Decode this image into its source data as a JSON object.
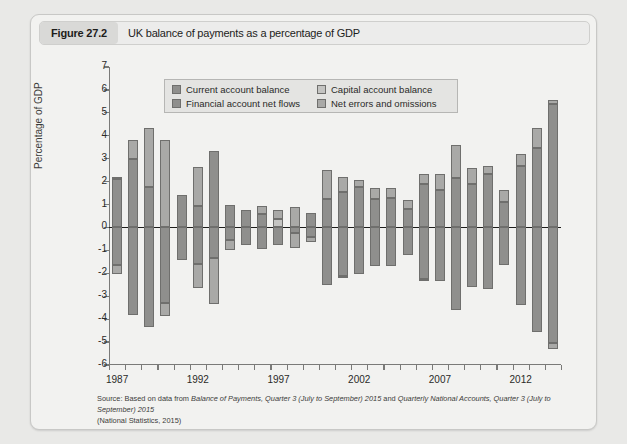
{
  "figure": {
    "number_label": "Figure 27.2",
    "caption": "UK balance of payments as a percentage of GDP"
  },
  "source_note": {
    "line1_prefix": "Source: Based on data from ",
    "line1_italic_a": "Balance of Payments, Quarter 3 (July to September) 2015",
    "line1_mid": " and ",
    "line1_italic_b": "Quarterly National Accounts, Quarter 3 (July to September) 2015",
    "line2": "(National Statistics, 2015)"
  },
  "chart_data": {
    "type": "bar",
    "subtype": "stacked-diverging",
    "title": "UK balance of payments as a percentage of GDP",
    "xlabel": "",
    "ylabel": "Percentage of GDP",
    "ylim": [
      -6,
      7
    ],
    "ytick_labels": [
      "7",
      "6",
      "5",
      "4",
      "3",
      "2",
      "1",
      "0",
      "-1",
      "-2",
      "-3",
      "-4",
      "-5",
      "-6"
    ],
    "ytick_values": [
      7,
      6,
      5,
      4,
      3,
      2,
      1,
      0,
      -1,
      -2,
      -3,
      -4,
      -5,
      -6
    ],
    "xtick_labels": [
      "1987",
      "1992",
      "1997",
      "2002",
      "2007",
      "2012"
    ],
    "xtick_values": [
      1987,
      1992,
      1997,
      2002,
      2007,
      2012
    ],
    "grid": false,
    "legend_position": "upper-left-inside",
    "categories": [
      1987,
      1988,
      1989,
      1990,
      1991,
      1992,
      1993,
      1994,
      1995,
      1996,
      1997,
      1998,
      1999,
      2000,
      2001,
      2002,
      2003,
      2004,
      2005,
      2006,
      2007,
      2008,
      2009,
      2010,
      2011,
      2012,
      2013,
      2014
    ],
    "series": [
      {
        "name": "Current account balance",
        "color": "#8f8f8d",
        "values": [
          -1.7,
          -3.8,
          -4.3,
          -3.3,
          -1.4,
          -1.7,
          -1.5,
          -0.6,
          -0.8,
          -0.6,
          0.0,
          -0.4,
          -2.6,
          -2.4,
          -2.0,
          -1.9,
          -1.6,
          -1.9,
          -2.2,
          -2.7,
          -2.3,
          -3.4,
          -2.8,
          -2.7,
          -1.7,
          -3.4,
          -4.5,
          -5.2
        ],
        "axis_side": "negative"
      },
      {
        "name": "Capital account balance",
        "color": "#bdbdbb",
        "values": [
          0.1,
          0.1,
          0.1,
          0.1,
          0.1,
          0.1,
          0.1,
          0.1,
          0.1,
          0.1,
          0.1,
          0.1,
          0.1,
          0.1,
          0.1,
          0.1,
          0.1,
          0.1,
          0.1,
          0.1,
          0.1,
          0.1,
          0.1,
          0.1,
          0.1,
          0.1,
          0.1,
          0.1
        ],
        "axis_side": "positive"
      },
      {
        "name": "Financial account net flows",
        "color": "#8f8f8d",
        "values": [
          2.1,
          3.0,
          1.75,
          0.0,
          1.4,
          0.9,
          1.0,
          0.5,
          0.4,
          0.2,
          -0.15,
          0.1,
          1.3,
          2.05,
          1.6,
          1.5,
          1.2,
          1.7,
          1.9,
          2.1,
          1.6,
          2.9,
          2.3,
          2.7,
          1.6,
          2.7,
          3.5,
          5.4
        ],
        "axis_side": "positive"
      },
      {
        "name": "Net errors and omissions",
        "color": "#a8a8a6",
        "values": [
          0.1,
          0.8,
          2.6,
          4.35,
          0.5,
          1.75,
          0.4,
          0.9,
          0.6,
          0.5,
          0.9,
          0.8,
          1.2,
          0.6,
          0.5,
          0.2,
          0.5,
          0.6,
          0.4,
          0.5,
          0.3,
          0.7,
          0.4,
          0.5,
          0.1,
          0.5,
          0.9,
          0.15
        ],
        "axis_side": "positive"
      }
    ],
    "bars": [
      {
        "year": 1987,
        "pos": [
          [
            0,
            2.1,
            "financial"
          ],
          [
            2.1,
            2.2,
            "errors"
          ]
        ],
        "neg": [
          [
            0,
            -1.65,
            "current"
          ],
          [
            -1.65,
            -2.05,
            "errors2"
          ]
        ]
      },
      {
        "year": 1988,
        "pos": [
          [
            0,
            3.0,
            "financial"
          ],
          [
            3.0,
            3.8,
            "errors"
          ]
        ],
        "neg": [
          [
            0,
            -3.8,
            "current"
          ]
        ]
      },
      {
        "year": 1989,
        "pos": [
          [
            0,
            1.75,
            "financial"
          ],
          [
            1.75,
            4.35,
            "errors"
          ]
        ],
        "neg": [
          [
            0,
            -4.35,
            "current"
          ]
        ]
      },
      {
        "year": 1990,
        "pos": [
          [
            0,
            3.8,
            "errors"
          ]
        ],
        "neg": [
          [
            0,
            -3.3,
            "current"
          ],
          [
            -3.3,
            -3.85,
            "errors2"
          ]
        ]
      },
      {
        "year": 1991,
        "pos": [
          [
            0,
            1.4,
            "financial"
          ]
        ],
        "neg": [
          [
            0,
            -1.4,
            "current"
          ]
        ]
      },
      {
        "year": 1992,
        "pos": [
          [
            0,
            0.95,
            "financial"
          ],
          [
            0.95,
            2.65,
            "errors"
          ]
        ],
        "neg": [
          [
            0,
            -1.6,
            "current"
          ],
          [
            -1.6,
            -2.65,
            "errors2"
          ]
        ]
      },
      {
        "year": 1993,
        "pos": [
          [
            0,
            3.35,
            "financial"
          ]
        ],
        "neg": [
          [
            0,
            -1.35,
            "current"
          ],
          [
            -1.35,
            -3.35,
            "errors2"
          ]
        ]
      },
      {
        "year": 1994,
        "pos": [
          [
            0,
            1.0,
            "financial"
          ]
        ],
        "neg": [
          [
            0,
            -0.55,
            "current"
          ],
          [
            -0.55,
            -1.0,
            "errors2"
          ]
        ]
      },
      {
        "year": 1995,
        "pos": [
          [
            0,
            0.75,
            "financial"
          ]
        ],
        "neg": [
          [
            0,
            -0.75,
            "current"
          ]
        ]
      },
      {
        "year": 1996,
        "pos": [
          [
            0,
            0.6,
            "financial"
          ],
          [
            0.6,
            0.95,
            "errors"
          ]
        ],
        "neg": [
          [
            0,
            -0.95,
            "current"
          ]
        ]
      },
      {
        "year": 1997,
        "pos": [
          [
            0,
            0.35,
            "capital"
          ],
          [
            0.35,
            0.75,
            "errors"
          ]
        ],
        "neg": [
          [
            0,
            -0.75,
            "current"
          ]
        ]
      },
      {
        "year": 1998,
        "pos": [
          [
            0,
            0.9,
            "errors"
          ]
        ],
        "neg": [
          [
            0,
            -0.25,
            "current"
          ],
          [
            -0.25,
            -0.9,
            "errors2"
          ]
        ]
      },
      {
        "year": 1999,
        "pos": [
          [
            0,
            0.65,
            "financial"
          ]
        ],
        "neg": [
          [
            0,
            -0.4,
            "current"
          ],
          [
            -0.4,
            -0.65,
            "errors2"
          ]
        ]
      },
      {
        "year": 2000,
        "pos": [
          [
            0,
            1.25,
            "financial"
          ],
          [
            1.25,
            2.5,
            "errors"
          ]
        ],
        "neg": [
          [
            0,
            -2.5,
            "current"
          ]
        ]
      },
      {
        "year": 2001,
        "pos": [
          [
            0,
            1.55,
            "financial"
          ],
          [
            1.55,
            2.2,
            "errors"
          ]
        ],
        "neg": [
          [
            0,
            -2.1,
            "current"
          ],
          [
            -2.1,
            -2.2,
            "errors2"
          ]
        ]
      },
      {
        "year": 2002,
        "pos": [
          [
            0,
            1.75,
            "financial"
          ],
          [
            1.75,
            2.05,
            "errors"
          ]
        ],
        "neg": [
          [
            0,
            -2.05,
            "current"
          ]
        ]
      },
      {
        "year": 2003,
        "pos": [
          [
            0,
            1.25,
            "financial"
          ],
          [
            1.25,
            1.7,
            "errors"
          ]
        ],
        "neg": [
          [
            0,
            -1.7,
            "current"
          ]
        ]
      },
      {
        "year": 2004,
        "pos": [
          [
            0,
            1.3,
            "financial"
          ],
          [
            1.3,
            1.7,
            "errors"
          ]
        ],
        "neg": [
          [
            0,
            -1.7,
            "current"
          ]
        ]
      },
      {
        "year": 2005,
        "pos": [
          [
            0,
            0.8,
            "financial"
          ],
          [
            0.8,
            1.2,
            "errors"
          ]
        ],
        "neg": [
          [
            0,
            -1.2,
            "current"
          ]
        ]
      },
      {
        "year": 2006,
        "pos": [
          [
            0,
            1.9,
            "financial"
          ],
          [
            1.9,
            2.35,
            "errors"
          ]
        ],
        "neg": [
          [
            0,
            -2.25,
            "current"
          ],
          [
            -2.25,
            -2.35,
            "errors2"
          ]
        ]
      },
      {
        "year": 2007,
        "pos": [
          [
            0,
            1.65,
            "financial"
          ],
          [
            1.65,
            2.35,
            "errors"
          ]
        ],
        "neg": [
          [
            0,
            -2.35,
            "current"
          ]
        ]
      },
      {
        "year": 2008,
        "pos": [
          [
            0,
            2.15,
            "financial"
          ],
          [
            2.15,
            3.6,
            "errors"
          ]
        ],
        "neg": [
          [
            0,
            -3.6,
            "current"
          ]
        ]
      },
      {
        "year": 2009,
        "pos": [
          [
            0,
            1.9,
            "financial"
          ],
          [
            1.9,
            2.6,
            "errors"
          ]
        ],
        "neg": [
          [
            0,
            -2.6,
            "current"
          ]
        ]
      },
      {
        "year": 2010,
        "pos": [
          [
            0,
            2.35,
            "financial"
          ],
          [
            2.35,
            2.7,
            "errors"
          ]
        ],
        "neg": [
          [
            0,
            -2.7,
            "current"
          ]
        ]
      },
      {
        "year": 2011,
        "pos": [
          [
            0,
            1.1,
            "financial"
          ],
          [
            1.1,
            1.65,
            "errors"
          ]
        ],
        "neg": [
          [
            0,
            -1.65,
            "current"
          ]
        ]
      },
      {
        "year": 2012,
        "pos": [
          [
            0,
            2.7,
            "financial"
          ],
          [
            2.7,
            3.2,
            "errors"
          ]
        ],
        "neg": [
          [
            0,
            -3.4,
            "current"
          ]
        ]
      },
      {
        "year": 2013,
        "pos": [
          [
            0,
            3.45,
            "financial"
          ],
          [
            3.45,
            4.35,
            "errors"
          ]
        ],
        "neg": [
          [
            0,
            -4.55,
            "current"
          ]
        ]
      },
      {
        "year": 2014,
        "pos": [
          [
            0,
            5.4,
            "financial"
          ],
          [
            5.4,
            5.55,
            "errors"
          ]
        ],
        "neg": [
          [
            0,
            -5.05,
            "current"
          ],
          [
            -5.05,
            -5.3,
            "errors2"
          ]
        ]
      }
    ],
    "segment_colors": {
      "current": "#8f8f8d",
      "capital": "#c4c4c2",
      "financial": "#8f8f8d",
      "errors": "#a9a9a7",
      "errors2": "#a9a9a7"
    }
  },
  "legend": {
    "items": [
      {
        "label": "Current account balance",
        "color": "#8f8f8d"
      },
      {
        "label": "Capital account balance",
        "color": "#c4c4c2"
      },
      {
        "label": "Financial account net flows",
        "color": "#8f8f8d"
      },
      {
        "label": "Net errors and omissions",
        "color": "#a9a9a7"
      }
    ]
  }
}
